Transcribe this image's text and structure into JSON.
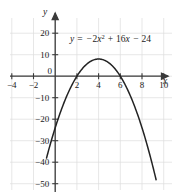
{
  "chart_data": {
    "type": "line",
    "title": "",
    "subtitle": "",
    "xlabel": "x",
    "ylabel": "y",
    "equation": "y = -2x^2 + 16x - 24",
    "equation_parts": {
      "lhs": "y",
      "equals": "=",
      "term1_sign": "−",
      "term1_coeff": "2",
      "term1_var": "x",
      "term1_exp": "2",
      "term2_sign": "+",
      "term2": "16",
      "term2_var": "x",
      "term3_sign": "−",
      "term3": "24"
    },
    "xlim": [
      -5,
      11
    ],
    "ylim": [
      -60,
      24
    ],
    "xticks": [
      -4,
      -2,
      0,
      2,
      4,
      6,
      8,
      10
    ],
    "xtick_labels": [
      "−4",
      "−2",
      "0",
      "2",
      "4",
      "6",
      "8",
      "10"
    ],
    "yticks": [
      20,
      10,
      0,
      -10,
      -20,
      -30,
      -40,
      -50,
      -60
    ],
    "ytick_labels": [
      "20",
      "10",
      "0",
      "−10",
      "−20",
      "−30",
      "−40",
      "−50",
      "−60"
    ],
    "grid": true,
    "legend": false,
    "vertex": [
      4,
      8
    ],
    "x_intercepts": [
      2,
      6
    ],
    "y_intercept": -24,
    "series": [
      {
        "name": "y = -2x^2 + 16x - 24",
        "color": "#232323",
        "x": [
          -0.8,
          -0.4,
          0,
          0.5,
          1,
          1.5,
          2,
          2.5,
          3,
          3.5,
          4,
          4.5,
          5,
          5.5,
          6,
          6.5,
          7,
          7.5,
          8,
          8.5,
          9,
          9.3
        ],
        "y": [
          -38.1,
          -30.7,
          -24,
          -16.5,
          -10,
          -4.5,
          0,
          3.5,
          6,
          7.5,
          8,
          7.5,
          6,
          3.5,
          0,
          -4.5,
          -10,
          -16.5,
          -24,
          -32.5,
          -42,
          -48.4
        ]
      }
    ]
  },
  "axes": {
    "x_axis_arrow": true,
    "y_axis_arrow": true,
    "x_axis_label": "x",
    "y_axis_label": "y"
  }
}
